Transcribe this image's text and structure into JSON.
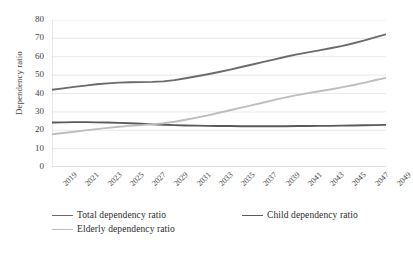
{
  "chart_data": {
    "type": "line",
    "title": "",
    "xlabel": "",
    "ylabel": "Dependency ratio",
    "ylim": [
      0,
      80
    ],
    "ytick_values": [
      0,
      10,
      20,
      30,
      40,
      50,
      60,
      70,
      80
    ],
    "grid": true,
    "legend_position": "bottom",
    "x": [
      2019,
      2020,
      2021,
      2022,
      2023,
      2024,
      2025,
      2026,
      2027,
      2028,
      2029,
      2030,
      2031,
      2032,
      2033,
      2034,
      2035,
      2036,
      2037,
      2038,
      2039,
      2040,
      2041,
      2042,
      2043,
      2044,
      2045,
      2046,
      2047,
      2048,
      2049
    ],
    "xtick_labels": [
      "2019",
      "2021",
      "2023",
      "2025",
      "2027",
      "2029",
      "2031",
      "2033",
      "2035",
      "2037",
      "2039",
      "2041",
      "2043",
      "2045",
      "2047",
      "2049"
    ],
    "series": [
      {
        "name": "Total dependency ratio",
        "color": "#6b6b6b",
        "width": 1.9,
        "values": [
          42.0,
          42.8,
          43.6,
          44.3,
          45.0,
          45.5,
          45.9,
          46.1,
          46.2,
          46.3,
          46.6,
          47.3,
          48.3,
          49.4,
          50.5,
          51.7,
          53.0,
          54.4,
          55.8,
          57.2,
          58.6,
          60.0,
          61.3,
          62.4,
          63.5,
          64.6,
          65.8,
          67.2,
          68.8,
          70.5,
          72.2
        ]
      },
      {
        "name": "Child dependency ratio",
        "color": "#5a5a5a",
        "width": 1.9,
        "values": [
          24.2,
          24.3,
          24.4,
          24.4,
          24.3,
          24.2,
          24.0,
          23.8,
          23.5,
          23.2,
          23.0,
          22.8,
          22.6,
          22.5,
          22.4,
          22.3,
          22.3,
          22.2,
          22.2,
          22.2,
          22.2,
          22.2,
          22.3,
          22.3,
          22.4,
          22.4,
          22.5,
          22.6,
          22.7,
          22.8,
          22.9
        ]
      },
      {
        "name": "Elderly dependency ratio",
        "color": "#bdbdbd",
        "width": 1.9,
        "values": [
          17.8,
          18.5,
          19.2,
          19.9,
          20.6,
          21.3,
          21.9,
          22.4,
          22.8,
          23.2,
          23.8,
          24.6,
          25.7,
          26.9,
          28.1,
          29.5,
          30.9,
          32.3,
          33.7,
          35.1,
          36.5,
          37.9,
          39.1,
          40.2,
          41.2,
          42.2,
          43.3,
          44.5,
          45.8,
          47.2,
          48.5
        ]
      }
    ]
  },
  "legend": {
    "items": [
      {
        "label": "Total dependency ratio"
      },
      {
        "label": "Child dependency ratio"
      },
      {
        "label": "Elderly dependency ratio"
      }
    ]
  },
  "axes": {
    "y_title": "Dependency ratio"
  }
}
